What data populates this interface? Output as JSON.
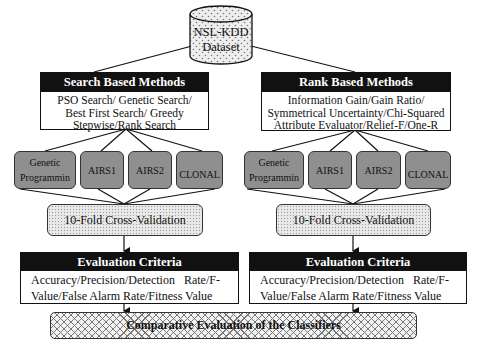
{
  "dataset": {
    "line1": "NSL-KDD",
    "line2": "Dataset"
  },
  "search_methods": {
    "title": "Search Based Methods",
    "lines": [
      "PSO Search/ Genetic Search/",
      "Best First Search/ Greedy",
      "Stepwise/Rank Search"
    ]
  },
  "rank_methods": {
    "title": "Rank Based Methods",
    "lines": [
      "Information Gain/Gain Ratio/",
      "Symmetrical Uncertainty/Chi-Squared",
      "Attribute Evaluator/Relief-F/One-R"
    ]
  },
  "classifiers_left": [
    {
      "line1": "Genetic",
      "line2": "Programmin"
    },
    {
      "line1": "AIRS1",
      "line2": ""
    },
    {
      "line1": "AIRS2",
      "line2": ""
    },
    {
      "line1": "CLONAL",
      "line2": ""
    }
  ],
  "classifiers_right": [
    {
      "line1": "Genetic",
      "line2": "Programmin"
    },
    {
      "line1": "AIRS1",
      "line2": ""
    },
    {
      "line1": "AIRS2",
      "line2": ""
    },
    {
      "line1": "CLONAL",
      "line2": ""
    }
  ],
  "cross_validation": {
    "left": "10-Fold Cross-Validation",
    "right": "10-Fold Cross-Validation"
  },
  "evaluation_left": {
    "title": "Evaluation Criteria",
    "line1": "Accuracy/Precision/Detection   Rate/F-",
    "line2": "Value/False Alarm Rate/Fitness Value"
  },
  "evaluation_right": {
    "title": "Evaluation Criteria",
    "line1": "Accuracy/Precision/Detection   Rate/F-",
    "line2": "Value/False Alarm Rate/Fitness Value"
  },
  "comparative": {
    "label": "Comparative Evaluation of the Classifiers"
  },
  "colors": {
    "header_bg": "#111111",
    "classifier_fill": "#8f8f8f",
    "line": "#111111"
  }
}
